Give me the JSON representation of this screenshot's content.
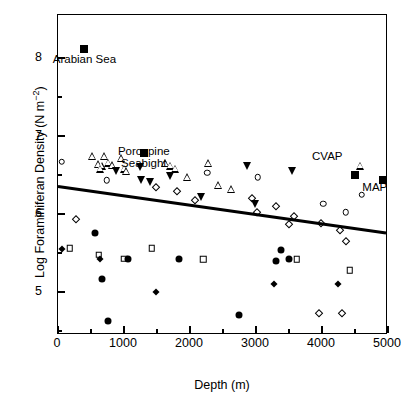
{
  "chart_data": {
    "type": "scatter",
    "title": "",
    "xlabel": "Depth (m)",
    "ylabel": "Log Foraminiferan Density (N m–2)",
    "xlim": [
      0,
      5000
    ],
    "ylim": [
      4.45,
      8.55
    ],
    "grid": false,
    "legend": "none",
    "x_ticks_major": [
      0,
      1000,
      2000,
      3000,
      4000,
      5000
    ],
    "x_tick_labels": [
      "0",
      "1000",
      "2000",
      "3000",
      "4000",
      "5000"
    ],
    "x_ticks_minor": [
      500,
      1500,
      2500,
      3500,
      4500
    ],
    "y_ticks_major": [
      5,
      6,
      7,
      8
    ],
    "y_tick_labels": [
      "5",
      "6",
      "7",
      "8"
    ],
    "y_ticks_minor": [
      4.5,
      5.5,
      6.5,
      7.5
    ],
    "annotations": [
      {
        "name": "arabian-sea",
        "text": "Arabian Sea",
        "x": 400,
        "y": 8.12,
        "label_dx": 0,
        "label_dy": -0.22
      },
      {
        "name": "porcupine-seabight",
        "text": "Porcupine\nSeabight",
        "x": 1300,
        "y": 6.78,
        "label_dx": 0,
        "label_dy": -0.22
      },
      {
        "name": "cvap",
        "text": "CVAP",
        "x": 4500,
        "y": 6.55,
        "label_dx": -420,
        "label_dy": 0.1
      },
      {
        "name": "map",
        "text": "MAP",
        "x": 4920,
        "y": 6.48,
        "label_dx": -120,
        "label_dy": -0.22
      }
    ],
    "trendline": {
      "x0": 0,
      "y0": 6.34,
      "x1": 5000,
      "y1": 5.74,
      "width": 3
    },
    "series": [
      {
        "name": "open-triangle-up",
        "marker": "open-triangle-up",
        "points": [
          [
            520,
            6.74
          ],
          [
            700,
            6.74
          ],
          [
            960,
            6.72
          ],
          [
            600,
            6.64
          ],
          [
            660,
            6.62
          ],
          [
            760,
            6.66
          ],
          [
            820,
            6.63
          ],
          [
            640,
            6.58
          ],
          [
            1000,
            6.58
          ],
          [
            1030,
            6.55
          ],
          [
            1620,
            6.65
          ],
          [
            1700,
            6.62
          ],
          [
            1780,
            6.58
          ],
          [
            2280,
            6.65
          ],
          [
            1960,
            6.47
          ],
          [
            2420,
            6.37
          ],
          [
            2620,
            6.32
          ],
          [
            4580,
            6.62
          ]
        ]
      },
      {
        "name": "filled-triangle-down",
        "marker": "filled-triangle-down",
        "points": [
          [
            880,
            6.55
          ],
          [
            1240,
            6.6
          ],
          [
            1260,
            6.44
          ],
          [
            1400,
            6.41
          ],
          [
            1700,
            6.49
          ],
          [
            2860,
            6.62
          ],
          [
            2160,
            6.22
          ],
          [
            2980,
            6.13
          ],
          [
            3540,
            6.55
          ]
        ]
      },
      {
        "name": "open-circle",
        "marker": "open-circle",
        "points": [
          [
            60,
            6.67
          ],
          [
            740,
            6.43
          ],
          [
            2260,
            6.53
          ],
          [
            3030,
            6.47
          ],
          [
            4600,
            6.25
          ],
          [
            4020,
            6.13
          ],
          [
            4360,
            6.02
          ]
        ]
      },
      {
        "name": "open-diamond",
        "marker": "open-diamond",
        "points": [
          [
            280,
            5.93
          ],
          [
            1480,
            6.35
          ],
          [
            1800,
            6.3
          ],
          [
            2080,
            6.18
          ],
          [
            2940,
            6.2
          ],
          [
            3300,
            6.1
          ],
          [
            3020,
            6.02
          ],
          [
            3580,
            5.97
          ],
          [
            3500,
            5.87
          ],
          [
            3980,
            5.88
          ],
          [
            4280,
            5.79
          ],
          [
            4360,
            5.65
          ],
          [
            3960,
            4.73
          ],
          [
            4300,
            4.73
          ]
        ]
      },
      {
        "name": "filled-circle",
        "marker": "filled-circle",
        "points": [
          [
            560,
            5.76
          ],
          [
            660,
            5.17
          ],
          [
            760,
            4.63
          ],
          [
            1060,
            5.43
          ],
          [
            1840,
            5.43
          ],
          [
            3380,
            5.54
          ],
          [
            3500,
            5.43
          ],
          [
            3300,
            5.4
          ],
          [
            2740,
            4.7
          ]
        ]
      },
      {
        "name": "open-square",
        "marker": "open-square",
        "points": [
          [
            180,
            5.56
          ],
          [
            620,
            5.48
          ],
          [
            1000,
            5.43
          ],
          [
            1420,
            5.56
          ],
          [
            2200,
            5.42
          ],
          [
            3620,
            5.42
          ],
          [
            4420,
            5.28
          ]
        ]
      },
      {
        "name": "filled-diamond",
        "marker": "filled-diamond",
        "points": [
          [
            60,
            5.55
          ],
          [
            640,
            5.42
          ],
          [
            1480,
            5.0
          ],
          [
            3280,
            5.1
          ],
          [
            4240,
            5.1
          ]
        ]
      },
      {
        "name": "filled-square",
        "marker": "filled-square",
        "points": [
          [
            400,
            8.12
          ],
          [
            1300,
            6.78
          ],
          [
            4500,
            6.5
          ],
          [
            4920,
            6.43
          ]
        ]
      }
    ]
  }
}
